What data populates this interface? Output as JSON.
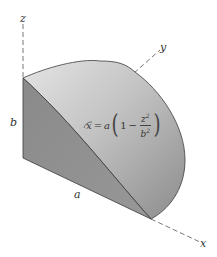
{
  "diagram": {
    "type": "3d-solid-figure",
    "axes": {
      "z": "z",
      "y": "y",
      "x": "x"
    },
    "dimensions": {
      "height_label": "b",
      "length_label": "a"
    },
    "equation": {
      "lhs": "x",
      "equals": "=",
      "coef": "a",
      "one": "1",
      "minus": "−",
      "num_base": "z",
      "num_exp": "2",
      "den_base": "b",
      "den_exp": "2",
      "full_text": "x = a(1 − z²/b²)"
    },
    "colors": {
      "side_face": "#8f8f8f",
      "curved_surface_light": "#d4d4d4",
      "curved_surface_dark": "#9a9a9a",
      "edges": "#3a3a3a",
      "axis_dash": "#555555"
    }
  }
}
